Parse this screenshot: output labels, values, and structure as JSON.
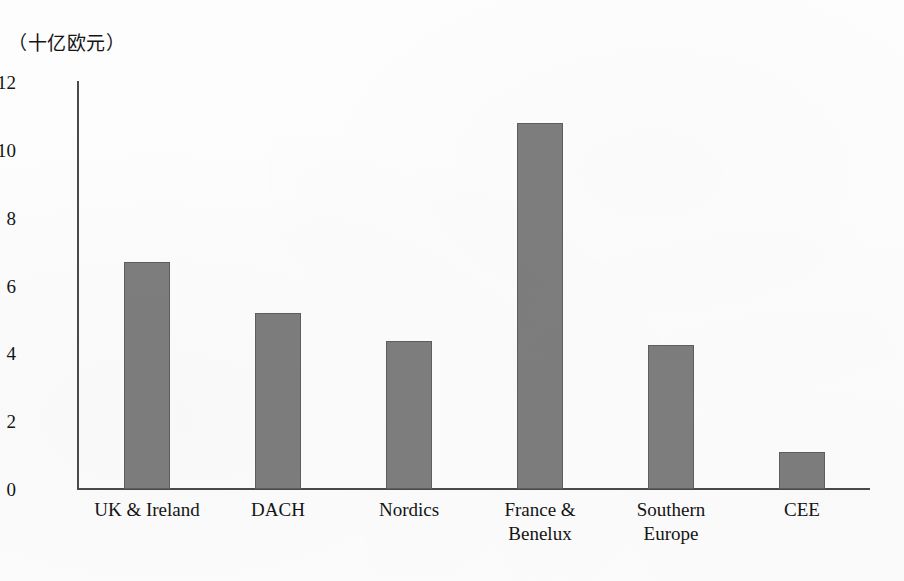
{
  "chart_data": {
    "type": "bar",
    "title": "",
    "subtitle": "",
    "unit_label": "（十亿欧元）",
    "xlabel": "",
    "ylabel": "",
    "categories": [
      "UK & Ireland",
      "DACH",
      "Nordics",
      "France &\nBenelux",
      "Southern\nEurope",
      "CEE"
    ],
    "values": [
      6.7,
      5.2,
      4.35,
      10.8,
      4.25,
      1.1
    ],
    "series": [
      {
        "name": "Investment",
        "values": [
          6.7,
          5.2,
          4.35,
          10.8,
          4.25,
          1.1
        ]
      }
    ],
    "ylim": [
      0,
      12
    ],
    "ytick_labels": [
      "0",
      "2",
      "4",
      "6",
      "8",
      "10",
      "12"
    ],
    "ytick_values": [
      0,
      2,
      4,
      6,
      8,
      10,
      12
    ],
    "grid": false,
    "legend": false,
    "legend_position": "none",
    "bar_color": "#7e7e7e",
    "bar_border_color": "#5e5e5e",
    "axis_color": "#4a4a4a",
    "background_color": "#fdfdfd"
  }
}
